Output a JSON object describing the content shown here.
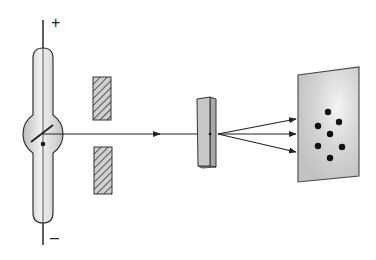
{
  "diagram": {
    "title": "",
    "labels": {
      "plus": "+",
      "minus": "–"
    },
    "components": [
      {
        "id": "xray-tube",
        "label": ""
      },
      {
        "id": "collimator-slits",
        "label": ""
      },
      {
        "id": "crystal",
        "label": ""
      },
      {
        "id": "detector-screen",
        "label": ""
      }
    ],
    "diffraction_spots": 7,
    "diffracted_rays": 3,
    "colors": {
      "line": "#222222",
      "tube_fill": "#d4d4d4",
      "crystal_fill": "#c8c8c8",
      "screen_fill": "#c9c9c9",
      "spot": "#111111"
    }
  }
}
